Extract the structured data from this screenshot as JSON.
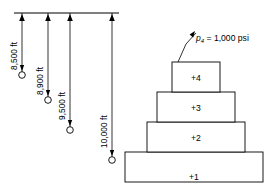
{
  "diagram": {
    "datum_line": {
      "name": "surface-datum-line"
    },
    "depth_dimensions": [
      {
        "label": "8,500 ft",
        "x": 22,
        "top": 13,
        "bottom": 75,
        "marker": "perforation-circle"
      },
      {
        "label": "8,900 ft",
        "x": 48,
        "top": 13,
        "bottom": 100,
        "marker": "perforation-circle"
      },
      {
        "label": "9,500 ft",
        "x": 70,
        "top": 13,
        "bottom": 130,
        "marker": "perforation-circle"
      },
      {
        "label": "10,000 ft",
        "x": 112,
        "top": 13,
        "bottom": 160,
        "marker": "perforation-circle"
      }
    ],
    "zone_blocks": [
      {
        "label": "+4",
        "x": 172,
        "y": 62,
        "width": 48,
        "height": 30
      },
      {
        "label": "+3",
        "x": 157,
        "y": 92,
        "width": 78,
        "height": 30
      },
      {
        "label": "+2",
        "x": 147,
        "y": 122,
        "width": 98,
        "height": 30
      },
      {
        "label": "+1",
        "x": 125,
        "y": 152,
        "width": 138,
        "height": 30
      }
    ],
    "pressure_annotation": {
      "symbol": "p",
      "subscript": "4",
      "equals": " = 1,000 psi",
      "full_text": "p4 = 1,000 psi",
      "x": 196,
      "y": 41
    },
    "colors": {
      "line": "#000000",
      "fill": "#ffffff",
      "background": "#ffffff"
    }
  }
}
